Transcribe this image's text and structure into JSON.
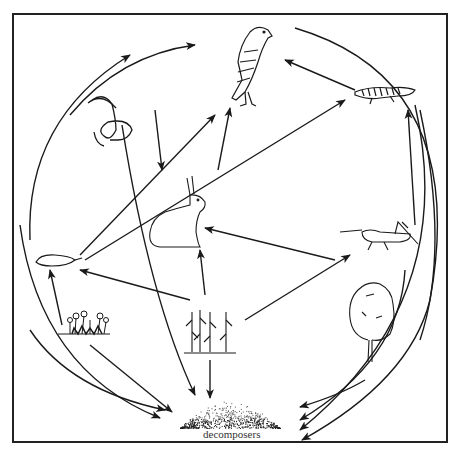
{
  "diagram": {
    "type": "food-web",
    "colors": {
      "ink": "#1a1a1a",
      "background": "#ffffff"
    },
    "nodes": [
      {
        "id": "hawk",
        "icon": "hawk-icon"
      },
      {
        "id": "snake",
        "icon": "snake-icon"
      },
      {
        "id": "lizard",
        "icon": "lizard-icon"
      },
      {
        "id": "rabbit",
        "icon": "rabbit-icon"
      },
      {
        "id": "mouse",
        "icon": "mouse-icon"
      },
      {
        "id": "grasshopper",
        "icon": "grasshopper-icon"
      },
      {
        "id": "wildflowers",
        "icon": "wildflowers-icon"
      },
      {
        "id": "corn",
        "icon": "corn-plants-icon"
      },
      {
        "id": "tree",
        "icon": "tree-icon"
      },
      {
        "id": "decomposers",
        "icon": "decomposers-pile-icon",
        "label": "decomposers"
      }
    ],
    "edges": [
      {
        "from": "snake",
        "to": "hawk"
      },
      {
        "from": "lizard",
        "to": "hawk"
      },
      {
        "from": "rabbit",
        "to": "hawk"
      },
      {
        "from": "mouse",
        "to": "hawk"
      },
      {
        "from": "mouse",
        "to": "snake"
      },
      {
        "from": "mouse",
        "to": "lizard"
      },
      {
        "from": "grasshopper",
        "to": "lizard"
      },
      {
        "from": "corn",
        "to": "rabbit"
      },
      {
        "from": "corn",
        "to": "mouse"
      },
      {
        "from": "corn",
        "to": "grasshopper"
      },
      {
        "from": "grasshopper",
        "to": "rabbit"
      },
      {
        "from": "wildflowers",
        "to": "mouse"
      },
      {
        "from": "snake",
        "to": "decomposers"
      },
      {
        "from": "mouse",
        "to": "decomposers"
      },
      {
        "from": "wildflowers",
        "to": "decomposers"
      },
      {
        "from": "corn",
        "to": "decomposers"
      },
      {
        "from": "tree",
        "to": "decomposers"
      },
      {
        "from": "grasshopper",
        "to": "decomposers"
      },
      {
        "from": "lizard",
        "to": "decomposers"
      },
      {
        "from": "hawk",
        "to": "decomposers"
      }
    ]
  }
}
